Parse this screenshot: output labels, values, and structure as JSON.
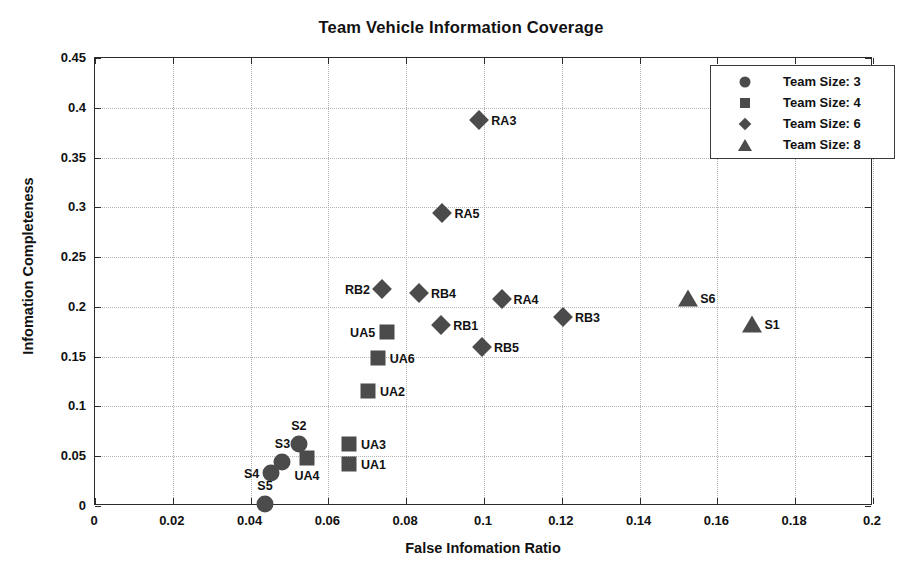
{
  "chart_data": {
    "type": "scatter",
    "title": "Team Vehicle Information Coverage",
    "xlabel": "False Infomation Ratio",
    "ylabel": "Infomation Completeness",
    "xlim": [
      0,
      0.2
    ],
    "ylim": [
      0,
      0.45
    ],
    "xticks": [
      "0",
      "0.02",
      "0.04",
      "0.06",
      "0.08",
      "0.1",
      "0.12",
      "0.14",
      "0.16",
      "0.18",
      "0.2"
    ],
    "xtickvalues": [
      0,
      0.02,
      0.04,
      0.06,
      0.08,
      0.1,
      0.12,
      0.14,
      0.16,
      0.18,
      0.2
    ],
    "yticks": [
      "0",
      "0.05",
      "0.1",
      "0.15",
      "0.2",
      "0.25",
      "0.3",
      "0.35",
      "0.4",
      "0.45"
    ],
    "ytickvalues": [
      0,
      0.05,
      0.1,
      0.15,
      0.2,
      0.25,
      0.3,
      0.35,
      0.4,
      0.45
    ],
    "grid": true,
    "legend_position": "upper right",
    "marker_color": "#4b4b4b",
    "legend": [
      {
        "label": "Team Size: 3",
        "marker": "circle"
      },
      {
        "label": "Team Size: 4",
        "marker": "square"
      },
      {
        "label": "Team Size: 6",
        "marker": "diamond"
      },
      {
        "label": "Team Size: 8",
        "marker": "triangle"
      }
    ],
    "series": [
      {
        "name": "Team Size: 3",
        "marker": "circle",
        "points": [
          {
            "label": "S2",
            "x": 0.0524,
            "y": 0.0625,
            "label_pos": "above"
          },
          {
            "label": "S3",
            "x": 0.0482,
            "y": 0.0442,
            "label_pos": "above"
          },
          {
            "label": "S4",
            "x": 0.0453,
            "y": 0.0335,
            "label_pos": "left"
          },
          {
            "label": "S5",
            "x": 0.0437,
            "y": 0.0022,
            "label_pos": "above"
          }
        ]
      },
      {
        "name": "Team Size: 4",
        "marker": "square",
        "points": [
          {
            "label": "UA5",
            "x": 0.0751,
            "y": 0.1752,
            "label_pos": "left"
          },
          {
            "label": "UA6",
            "x": 0.0727,
            "y": 0.1484,
            "label_pos": "right"
          },
          {
            "label": "UA2",
            "x": 0.0702,
            "y": 0.116,
            "label_pos": "right"
          },
          {
            "label": "UA3",
            "x": 0.0653,
            "y": 0.0625,
            "label_pos": "right"
          },
          {
            "label": "UA1",
            "x": 0.0653,
            "y": 0.042,
            "label_pos": "right"
          },
          {
            "label": "UA4",
            "x": 0.0545,
            "y": 0.0478,
            "label_pos": "below"
          }
        ]
      },
      {
        "name": "Team Size: 6",
        "marker": "diamond",
        "points": [
          {
            "label": "RA3",
            "x": 0.0988,
            "y": 0.388,
            "label_pos": "right"
          },
          {
            "label": "RA5",
            "x": 0.0893,
            "y": 0.2945,
            "label_pos": "right"
          },
          {
            "label": "RB2",
            "x": 0.0738,
            "y": 0.218,
            "label_pos": "left"
          },
          {
            "label": "RB4",
            "x": 0.0833,
            "y": 0.2135,
            "label_pos": "right"
          },
          {
            "label": "RA4",
            "x": 0.1045,
            "y": 0.2075,
            "label_pos": "right"
          },
          {
            "label": "RB3",
            "x": 0.1203,
            "y": 0.1895,
            "label_pos": "right"
          },
          {
            "label": "RB1",
            "x": 0.089,
            "y": 0.1815,
            "label_pos": "right"
          },
          {
            "label": "RB5",
            "x": 0.0995,
            "y": 0.16,
            "label_pos": "right"
          }
        ]
      },
      {
        "name": "Team Size: 8",
        "marker": "triangle",
        "points": [
          {
            "label": "S6",
            "x": 0.1525,
            "y": 0.2085,
            "label_pos": "right"
          },
          {
            "label": "S1",
            "x": 0.169,
            "y": 0.1825,
            "label_pos": "right"
          }
        ]
      }
    ]
  }
}
